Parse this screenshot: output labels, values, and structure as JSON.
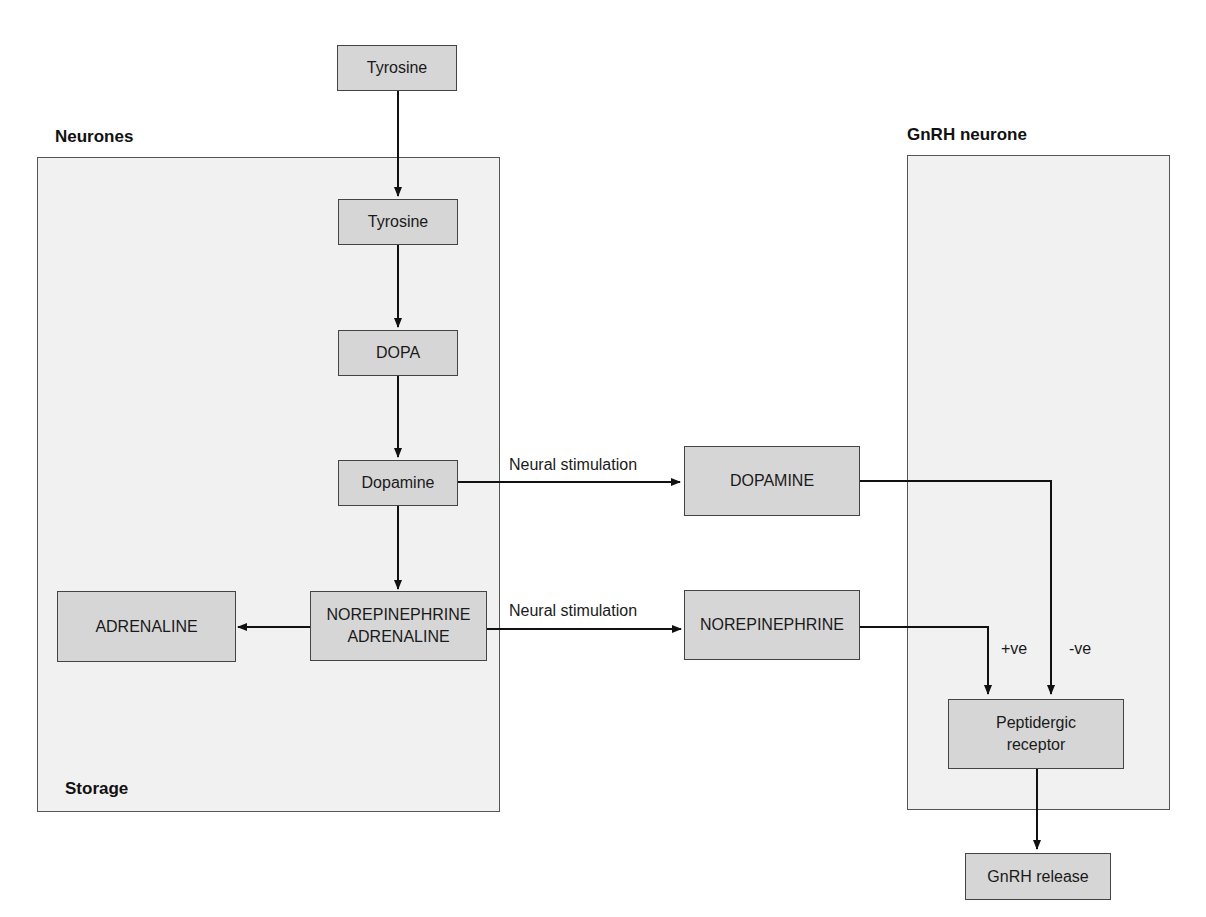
{
  "regions": {
    "neurones": {
      "title": "Neurones",
      "footer": "Storage"
    },
    "gnrh_neurone": {
      "title": "GnRH neurone"
    }
  },
  "nodes": {
    "tyrosine_outside": "Tyrosine",
    "tyrosine_inside": "Tyrosine",
    "dopa": "DOPA",
    "dopamine_inside": "Dopamine",
    "norepinephrine_adrenaline": "NOREPINEPHRINE\nADRENALINE",
    "adrenaline": "ADRENALINE",
    "dopamine_released": "DOPAMINE",
    "norepinephrine_released": "NOREPINEPHRINE",
    "peptidergic_receptor": "Peptidergic\nreceptor",
    "gnrh_release": "GnRH release"
  },
  "edge_labels": {
    "dopamine_stimulation": "Neural stimulation",
    "norepinephrine_stimulation": "Neural stimulation",
    "positive_effect": "+ve",
    "negative_effect": "-ve"
  },
  "colors": {
    "node_fill": "#d6d6d6",
    "region_fill": "#f1f1f1",
    "stroke": "#1a1a1a"
  }
}
